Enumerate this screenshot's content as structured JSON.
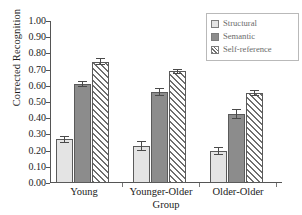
{
  "chart_data": {
    "type": "bar",
    "title": "",
    "subtitle": "",
    "xlabel": "Group",
    "ylabel": "Corrected Recognition",
    "categories": [
      "Young",
      "Younger-Older",
      "Older-Older"
    ],
    "ylim": [
      0.0,
      1.0
    ],
    "ytick_labels": [
      "1.00",
      "0.90",
      "0.80",
      "0.70",
      "0.60",
      "0.50",
      "0.40",
      "0.30",
      "0.20",
      "0.10",
      "0.00"
    ],
    "ytick_values": [
      1.0,
      0.9,
      0.8,
      0.7,
      0.6,
      0.5,
      0.4,
      0.3,
      0.2,
      0.1,
      0.0
    ],
    "grid": false,
    "legend_position": "top-right",
    "series": [
      {
        "name": "Structural",
        "color": "#e4e4e4",
        "pattern": "solid",
        "values": [
          0.27,
          0.23,
          0.2
        ],
        "errors": [
          0.02,
          0.03,
          0.025
        ]
      },
      {
        "name": "Semantic",
        "color": "#8c8c8c",
        "pattern": "solid",
        "values": [
          0.61,
          0.56,
          0.425
        ],
        "errors": [
          0.02,
          0.025,
          0.03
        ]
      },
      {
        "name": "Self-reference",
        "color": "#6f6f6f",
        "pattern": "diagonal-hatch",
        "values": [
          0.75,
          0.69,
          0.555
        ],
        "errors": [
          0.02,
          0.015,
          0.02
        ]
      }
    ]
  },
  "legend": {
    "items": [
      {
        "label": "Structural"
      },
      {
        "label": "Semantic"
      },
      {
        "label": "Self-reference"
      }
    ]
  },
  "axes": {
    "y_title": "Corrected Recognition",
    "x_title": "Group"
  }
}
